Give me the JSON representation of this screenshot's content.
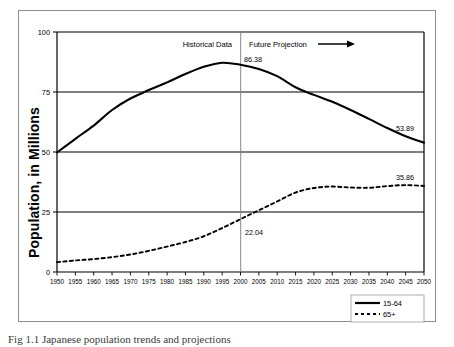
{
  "figure": {
    "caption": "Fig 1.1 Japanese population trends and projections"
  },
  "chart_data": {
    "type": "line",
    "title": "",
    "xlabel": "",
    "ylabel": "Population, in Millions",
    "xlim": [
      1950,
      2050
    ],
    "ylim": [
      0,
      100
    ],
    "yticks": [
      "0",
      "25",
      "50",
      "75",
      "100"
    ],
    "grid": true,
    "grid_axis": "y",
    "legend_position": "bottom-right",
    "categories": [
      1950,
      1955,
      1960,
      1965,
      1970,
      1975,
      1980,
      1985,
      1990,
      1995,
      2000,
      2005,
      2010,
      2015,
      2020,
      2025,
      2030,
      2035,
      2040,
      2045,
      2050
    ],
    "xticks": [
      "1950",
      "1955",
      "1960",
      "1965",
      "1970",
      "1975",
      "1980",
      "1985",
      "1990",
      "1995",
      "2000",
      "2005",
      "2010",
      "2015",
      "2020",
      "2025",
      "2030",
      "2035",
      "2040",
      "2045",
      "2050"
    ],
    "series": [
      {
        "name": "15-64",
        "style": "solid",
        "color": "#000000",
        "values": [
          49.8,
          55.5,
          61.0,
          67.5,
          72.3,
          75.8,
          79.0,
          82.5,
          85.5,
          87.2,
          86.38,
          84.6,
          81.6,
          77.0,
          73.8,
          70.9,
          67.5,
          63.8,
          60.0,
          56.6,
          53.89
        ]
      },
      {
        "name": "65+",
        "style": "dashed",
        "color": "#000000",
        "values": [
          4.1,
          4.8,
          5.4,
          6.2,
          7.3,
          8.8,
          10.6,
          12.5,
          14.9,
          18.3,
          22.04,
          25.7,
          29.4,
          33.1,
          35.0,
          35.6,
          35.2,
          35.1,
          35.8,
          36.2,
          35.86
        ]
      }
    ],
    "data_labels": [
      {
        "text": "86.38",
        "series": "15-64",
        "x": 2000,
        "y": 86.38
      },
      {
        "text": "53.89",
        "series": "15-64",
        "x": 2050,
        "y": 53.89
      },
      {
        "text": "22.04",
        "series": "65+",
        "x": 2000,
        "y": 22.04
      },
      {
        "text": "35.86",
        "series": "65+",
        "x": 2050,
        "y": 35.86
      }
    ],
    "annotations": [
      {
        "text": "Historical Data",
        "x": 1985,
        "y": 97
      },
      {
        "text": "Future Projection",
        "x": 2015,
        "y": 97
      }
    ],
    "divider": {
      "x": 2000,
      "label": "projection-divider"
    },
    "legend": [
      {
        "label": "15-64",
        "style": "solid"
      },
      {
        "label": "65+",
        "style": "dashed"
      }
    ]
  }
}
